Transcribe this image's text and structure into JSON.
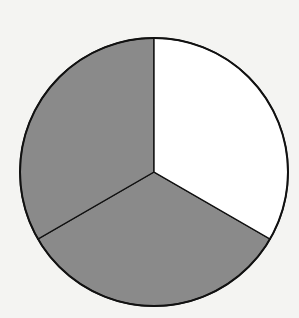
{
  "diagram": {
    "type": "fraction-circle",
    "parts_total": 3,
    "parts_shaded": 2,
    "fraction": "2/3",
    "colors": {
      "background": "#f4f4f2",
      "shaded": "#8a8a8a",
      "unshaded": "#ffffff",
      "outline": "#111111"
    },
    "geometry": {
      "cx": 154,
      "cy": 172,
      "r": 134
    }
  },
  "chart_data": {
    "type": "pie",
    "categories": [
      "Shaded part 1",
      "Shaded part 2",
      "Unshaded part"
    ],
    "values": [
      1,
      1,
      1
    ],
    "shaded": [
      true,
      true,
      false
    ],
    "title": "",
    "legend": "none"
  }
}
